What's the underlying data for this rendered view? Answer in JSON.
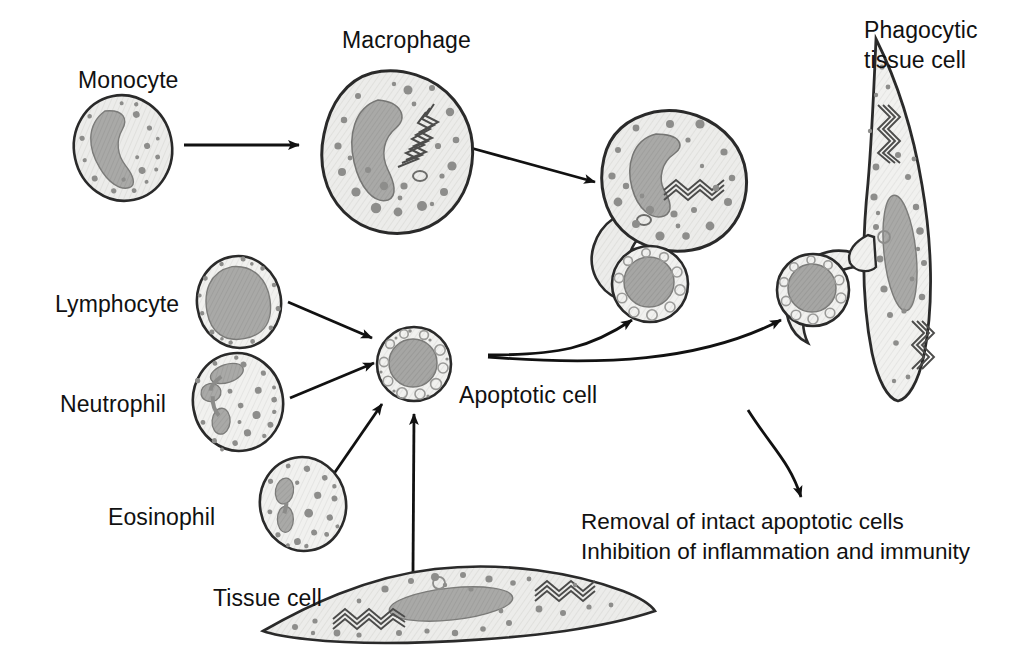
{
  "figure": {
    "background_color": "#ffffff",
    "ink_color": "#111111"
  },
  "palette": {
    "cell_fill": "#e9e9e7",
    "cell_outline": "#2a2a2a",
    "nucleus_fill": "#a8a8a6",
    "nucleus_outline": "#6f6f6e",
    "granule_fill": "#9a9a98",
    "granule_dark": "#6e6e6c",
    "apoptotic_nucleus": "#a3a3a1",
    "er_color": "#575756"
  },
  "labels": {
    "monocyte": "Monocyte",
    "macrophage": "Macrophage",
    "phagocytic_tissue_cell_line1": "Phagocytic",
    "phagocytic_tissue_cell_line2": "tissue cell",
    "lymphocyte": "Lymphocyte",
    "neutrophil": "Neutrophil",
    "eosinophil": "Eosinophil",
    "apoptotic_cell": "Apoptotic cell",
    "tissue_cell": "Tissue cell",
    "outcome_line1": "Removal of intact apoptotic cells",
    "outcome_line2": "Inhibition of inflammation and immunity"
  },
  "cells": [
    {
      "id": "monocyte",
      "label": "Monocyte",
      "shape": "round-oval",
      "nucleus": "kidney-shaped",
      "cx": 123,
      "cy": 148,
      "rx": 49,
      "ry": 53
    },
    {
      "id": "macrophage",
      "label": "Macrophage",
      "shape": "irregular-amoeboid",
      "nucleus": "kidney-shaped",
      "cx": 398,
      "cy": 152,
      "rx": 72,
      "ry": 80
    },
    {
      "id": "lymphocyte",
      "label": "Lymphocyte",
      "shape": "round-oval",
      "nucleus": "large-round",
      "cx": 239,
      "cy": 302,
      "rx": 42,
      "ry": 46
    },
    {
      "id": "neutrophil",
      "label": "Neutrophil",
      "shape": "round-oval",
      "nucleus": "multi-lobed",
      "cx": 238,
      "cy": 402,
      "rx": 45,
      "ry": 49
    },
    {
      "id": "eosinophil",
      "label": "Eosinophil",
      "shape": "round-oval",
      "nucleus": "bilobed",
      "cx": 303,
      "cy": 504,
      "rx": 43,
      "ry": 47
    },
    {
      "id": "tissue-cell",
      "label": "Tissue cell",
      "shape": "spindle-elongated",
      "nucleus": "elongated",
      "cx": 455,
      "cy": 603,
      "rx": 200,
      "ry": 40
    },
    {
      "id": "apoptotic-cell",
      "label": "Apoptotic cell",
      "shape": "round-blebbed",
      "nucleus": "condensed-pyknotic",
      "cx": 414,
      "cy": 364,
      "rx": 37,
      "ry": 37
    },
    {
      "id": "phagocytosing-macrophage",
      "label": "Macrophage engulfing apoptotic cell",
      "shape": "irregular-amoeboid-with-pseudopod",
      "nucleus": "kidney-shaped",
      "cx": 672,
      "cy": 180,
      "rx": 72,
      "ry": 68
    },
    {
      "id": "engulfed-apoptotic-cell-macrophage",
      "label": "Apoptotic cell being engulfed",
      "shape": "round",
      "cx": 650,
      "cy": 284,
      "rx": 38,
      "ry": 38
    },
    {
      "id": "phagocytic-tissue-cell",
      "label": "Phagocytic tissue cell",
      "shape": "spindle-vertical-with-pseudopod",
      "nucleus": "elongated",
      "cx": 890,
      "cy": 215,
      "rx": 55,
      "ry": 180
    },
    {
      "id": "engulfed-apoptotic-cell-tissue",
      "label": "Apoptotic cell being engulfed",
      "shape": "round",
      "cx": 813,
      "cy": 290,
      "rx": 36,
      "ry": 36
    }
  ],
  "arrows": [
    {
      "id": "monocyte-to-macrophage",
      "from": "monocyte",
      "to": "macrophage",
      "style": "straight"
    },
    {
      "id": "macrophage-to-phagocytosing",
      "from": "macrophage",
      "to": "phagocytosing-macrophage",
      "style": "straight"
    },
    {
      "id": "lymphocyte-to-apoptotic",
      "from": "lymphocyte",
      "to": "apoptotic-cell",
      "style": "straight"
    },
    {
      "id": "neutrophil-to-apoptotic",
      "from": "neutrophil",
      "to": "apoptotic-cell",
      "style": "straight"
    },
    {
      "id": "eosinophil-to-apoptotic",
      "from": "eosinophil",
      "to": "apoptotic-cell",
      "style": "straight"
    },
    {
      "id": "tissue-cell-to-apoptotic",
      "from": "tissue-cell",
      "to": "apoptotic-cell",
      "style": "straight"
    },
    {
      "id": "apoptotic-to-macrophage-engulf",
      "from": "apoptotic-cell",
      "to": "phagocytosing-macrophage",
      "style": "curved"
    },
    {
      "id": "apoptotic-to-tissue-engulf",
      "from": "apoptotic-cell",
      "to": "phagocytic-tissue-cell",
      "style": "curved"
    },
    {
      "id": "engulf-to-outcome",
      "from": "phagocytosing-macrophage",
      "to": "outcome-text",
      "style": "curved-down"
    }
  ]
}
